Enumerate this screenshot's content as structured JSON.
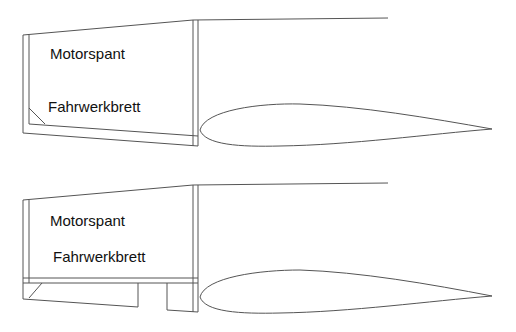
{
  "diagrams": [
    {
      "id": "top",
      "labels": {
        "motor": "Motorspant",
        "gear": "Fahrwerkbrett"
      }
    },
    {
      "id": "bottom",
      "labels": {
        "motor": "Motorspant",
        "gear": "Fahrwerkbrett"
      }
    }
  ],
  "colors": {
    "line": "#555555",
    "text": "#111111",
    "background": "#ffffff"
  }
}
